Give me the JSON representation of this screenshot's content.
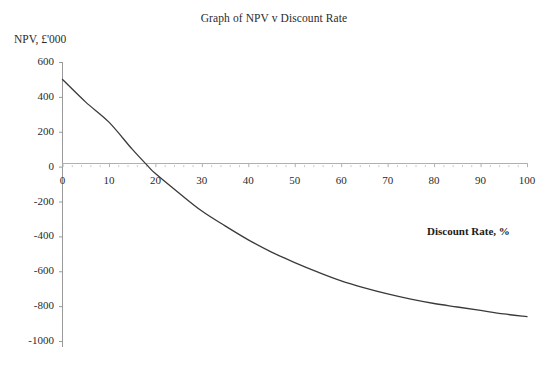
{
  "chart_data": {
    "type": "line",
    "title": "Graph of NPV v Discount Rate",
    "xlabel": "Discount Rate, %",
    "ylabel": "NPV, £'000",
    "xlim": [
      0,
      100
    ],
    "ylim": [
      -1000,
      600
    ],
    "grid": false,
    "legend": null,
    "x_ticks": [
      0,
      10,
      20,
      30,
      40,
      50,
      60,
      70,
      80,
      90,
      100
    ],
    "x_tick_labels": [
      "0",
      "10",
      "20",
      "30",
      "40",
      "50",
      "60",
      "70",
      "80",
      "90",
      "100"
    ],
    "y_ticks": [
      600,
      400,
      200,
      0,
      -200,
      -400,
      -600,
      -800,
      -1000
    ],
    "y_tick_labels": [
      "600",
      "400",
      "200",
      "0",
      "-200",
      "-400",
      "-600",
      "-800",
      "-1000"
    ],
    "series": [
      {
        "name": "NPV",
        "color": "#3a3a3a",
        "x": [
          0,
          5,
          10,
          15,
          18.5,
          20,
          25,
          30,
          35,
          40,
          45,
          50,
          55,
          60,
          65,
          70,
          75,
          80,
          85,
          90,
          95,
          100
        ],
        "y": [
          500,
          370,
          255,
          100,
          0,
          -40,
          -150,
          -255,
          -340,
          -420,
          -490,
          -550,
          -605,
          -655,
          -695,
          -730,
          -760,
          -785,
          -805,
          -825,
          -845,
          -860
        ]
      }
    ],
    "annotations": [
      {
        "text": "zero crossing approximately at 18.5% discount rate"
      }
    ]
  },
  "axes": {
    "y_axis_name": "npv-axis",
    "x_axis_name": "discount-rate-axis"
  }
}
